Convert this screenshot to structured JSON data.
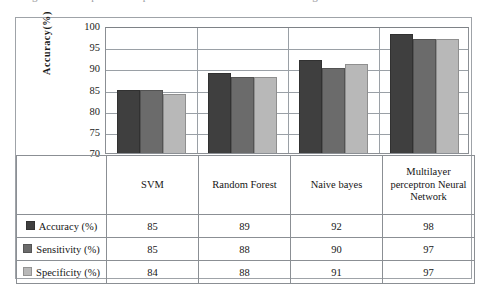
{
  "figure": {
    "caption_sliver": "Figure 4: Comparison of performance of the classification algorithms"
  },
  "chart_data": {
    "type": "bar",
    "title": "",
    "subtitle": "",
    "xlabel": "",
    "ylabel": "Accuracy(%)",
    "ylim": [
      70,
      100
    ],
    "ytick_labels": [
      "100",
      "95",
      "90",
      "85",
      "80",
      "75",
      "70"
    ],
    "ytick_values": [
      100,
      95,
      90,
      85,
      80,
      75,
      70
    ],
    "grid": true,
    "legend_position": "data-table-left",
    "categories": [
      "SVM",
      "Random Forest",
      "Naive bayes",
      "Multilayer perceptron Neural Network"
    ],
    "series": [
      {
        "name": "Accuracy (%)",
        "color": "#3f3f3f",
        "values": [
          85,
          89,
          92,
          98
        ]
      },
      {
        "name": "Sensitivity (%)",
        "color": "#6b6b6b",
        "values": [
          85,
          88,
          90,
          97
        ]
      },
      {
        "name": "Specificity (%)",
        "color": "#b8b8b8",
        "values": [
          84,
          88,
          91,
          97
        ]
      }
    ],
    "table": {
      "row_headers": [
        "Accuracy (%)",
        "Sensitivity (%)",
        "Specificity (%)"
      ],
      "column_headers": [
        "SVM",
        "Random Forest",
        "Naive bayes",
        "Multilayer perceptron Neural Network"
      ],
      "rows": [
        [
          "85",
          "89",
          "92",
          "98"
        ],
        [
          "85",
          "88",
          "90",
          "97"
        ],
        [
          "84",
          "88",
          "91",
          "97"
        ]
      ]
    }
  }
}
